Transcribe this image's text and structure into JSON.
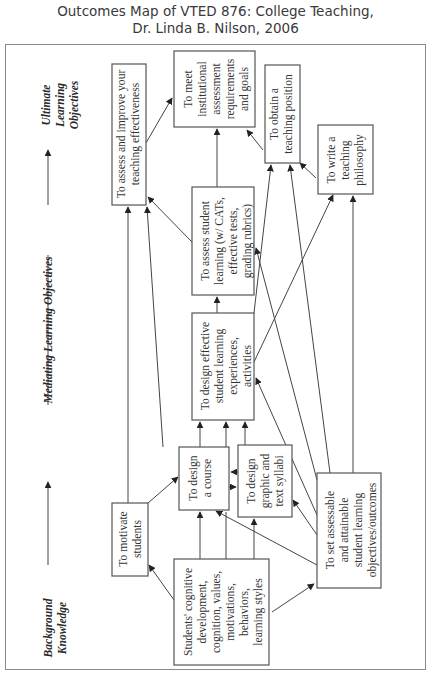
{
  "title": {
    "line1": "Outcomes Map of VTED 876: College Teaching,",
    "line2": "Dr. Linda B. Nilson, 2006"
  },
  "axis": {
    "background": [
      "Background",
      "Knowledge"
    ],
    "mediating": "Mediating Learning Objectives",
    "ultimate": [
      "Ultimate",
      "Learning",
      "Objectives"
    ]
  },
  "boxes": {
    "assess_improve": [
      "To assess and improve your",
      "teaching effectiveness"
    ],
    "meet_institutional": [
      "To meet",
      "institutional",
      "assessment",
      "requirements",
      "and goals"
    ],
    "obtain_position": [
      "To obtain a",
      "teaching position"
    ],
    "write_philosophy": [
      "To write a",
      "teaching",
      "philosophy"
    ],
    "assess_student": [
      "To assess student",
      "learning (w/ CATs,",
      "effective tests,",
      "grading rubrics)"
    ],
    "design_experiences": [
      "To design effective",
      "student learning",
      "experiences,",
      "activities"
    ],
    "design_course": [
      "To design",
      "a course"
    ],
    "design_syllabi": [
      "To design",
      "graphic and",
      "text syllabi"
    ],
    "motivate": [
      "To motivate",
      "students"
    ],
    "students_cognitive": [
      "Students' cognitive",
      "development,",
      "cognition, values,",
      "motivations,",
      "behaviors,",
      "learning styles"
    ],
    "set_objectives": [
      "To set assessable",
      "and attainable",
      "student learning",
      "objectives/outcomes"
    ]
  },
  "colors": {
    "stroke": "#555555",
    "text": "#333333",
    "frame": "#8a8a8a"
  }
}
